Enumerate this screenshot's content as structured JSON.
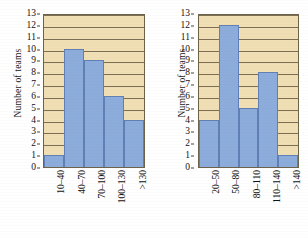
{
  "figure": {
    "panels": [
      {
        "id": "left-histogram",
        "ylabel": "Number of teams",
        "yticks": [
          "0",
          "1",
          "2",
          "3",
          "4",
          "5",
          "6",
          "7",
          "8",
          "9",
          "10",
          "11",
          "12",
          "13"
        ],
        "ymin": 0,
        "ymax": 13,
        "categories": [
          "10–40",
          "40–70",
          "70–100",
          "100–130",
          ">130"
        ],
        "values": [
          1,
          10,
          9,
          6,
          4
        ]
      },
      {
        "id": "right-histogram",
        "ylabel": "Number of teams",
        "yticks": [
          "0",
          "1",
          "2",
          "3",
          "4",
          "5",
          "6",
          "7",
          "8",
          "9",
          "10",
          "11",
          "12",
          "13"
        ],
        "ymin": 0,
        "ymax": 13,
        "categories": [
          "20–50",
          "50–80",
          "80–110",
          "110–140",
          ">140"
        ],
        "values": [
          4,
          12,
          5,
          8,
          1
        ]
      }
    ]
  },
  "colors": {
    "bar_fill": "#8cacdc",
    "bar_stroke": "#5f7fb5",
    "plot_background": "#f0dfb4",
    "gridline": "#7b6e52",
    "axis": "#6d6148",
    "text": "#111111"
  },
  "chart_data": [
    {
      "type": "bar",
      "title": "",
      "subtitle": "",
      "xlabel": "",
      "ylabel": "Number of teams",
      "categories": [
        "10–40",
        "40–70",
        "70–100",
        "100–130",
        ">130"
      ],
      "values": [
        1,
        10,
        9,
        6,
        4
      ],
      "ylim": [
        0,
        13
      ],
      "ytick_step": 1,
      "grid": "horizontal",
      "legend": "none",
      "bar_gap": 0,
      "annotations": []
    },
    {
      "type": "bar",
      "title": "",
      "subtitle": "",
      "xlabel": "",
      "ylabel": "Number of teams",
      "categories": [
        "20–50",
        "50–80",
        "80–110",
        "110–140",
        ">140"
      ],
      "values": [
        4,
        12,
        5,
        8,
        1
      ],
      "ylim": [
        0,
        13
      ],
      "ytick_step": 1,
      "grid": "horizontal",
      "legend": "none",
      "bar_gap": 0,
      "annotations": []
    }
  ]
}
